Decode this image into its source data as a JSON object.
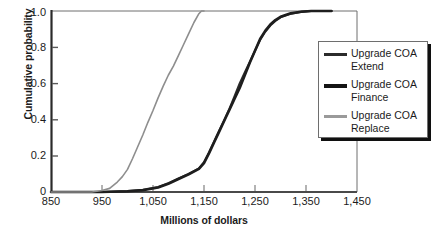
{
  "chart_data": {
    "type": "line",
    "title": "",
    "xlabel": "Millions of dollars",
    "ylabel": "Cumulative probability",
    "xlim": [
      850,
      1450
    ],
    "ylim": [
      0,
      1.0
    ],
    "grid": false,
    "legend_position": "right",
    "xticks": [
      "850",
      "950",
      "1,050",
      "1,150",
      "1,250",
      "1,350",
      "1,450"
    ],
    "xtick_values": [
      850,
      950,
      1050,
      1150,
      1250,
      1350,
      1450
    ],
    "yticks": [
      "0",
      "0.2",
      "0.4",
      "0.6",
      "0.8",
      "1.0"
    ],
    "ytick_values": [
      0,
      0.2,
      0.4,
      0.6,
      0.8,
      1.0
    ],
    "series": [
      {
        "name": "Upgrade COA Extend",
        "color": "#2b2b2b",
        "width": 2.1,
        "x": [
          850,
          950,
          1000,
          1030,
          1060,
          1080,
          1100,
          1120,
          1140,
          1150,
          1160,
          1170,
          1180,
          1190,
          1200,
          1210,
          1220,
          1230,
          1240,
          1250,
          1260,
          1270,
          1280,
          1290,
          1300,
          1320,
          1340,
          1360,
          1400
        ],
        "y": [
          0.0,
          0.0,
          0.005,
          0.012,
          0.028,
          0.048,
          0.075,
          0.1,
          0.13,
          0.165,
          0.22,
          0.28,
          0.34,
          0.4,
          0.46,
          0.53,
          0.6,
          0.66,
          0.72,
          0.78,
          0.84,
          0.885,
          0.92,
          0.945,
          0.965,
          0.985,
          0.995,
          1.0,
          1.0
        ]
      },
      {
        "name": "Upgrade COA Finance",
        "color": "#1e1e1e",
        "width": 2.6,
        "x": [
          850,
          950,
          1000,
          1030,
          1060,
          1080,
          1100,
          1120,
          1140,
          1150,
          1160,
          1170,
          1180,
          1190,
          1200,
          1210,
          1220,
          1230,
          1240,
          1250,
          1260,
          1270,
          1280,
          1290,
          1300,
          1320,
          1340,
          1360,
          1400
        ],
        "y": [
          0.0,
          0.0,
          0.004,
          0.01,
          0.025,
          0.045,
          0.072,
          0.098,
          0.128,
          0.16,
          0.215,
          0.275,
          0.335,
          0.395,
          0.455,
          0.515,
          0.575,
          0.645,
          0.715,
          0.78,
          0.845,
          0.89,
          0.925,
          0.95,
          0.968,
          0.987,
          0.996,
          1.0,
          1.0
        ]
      },
      {
        "name": "Upgrade COA Replace",
        "color": "#8e8e8e",
        "width": 1.6,
        "x": [
          850,
          930,
          950,
          965,
          980,
          990,
          1000,
          1010,
          1020,
          1030,
          1040,
          1050,
          1060,
          1070,
          1080,
          1090,
          1100,
          1110,
          1120,
          1130,
          1140,
          1145,
          1150
        ],
        "y": [
          0.0,
          0.0,
          0.008,
          0.02,
          0.055,
          0.085,
          0.125,
          0.185,
          0.25,
          0.315,
          0.385,
          0.45,
          0.52,
          0.585,
          0.645,
          0.695,
          0.755,
          0.815,
          0.875,
          0.935,
          0.985,
          1.0,
          1.0
        ]
      }
    ]
  },
  "legend": {
    "items": [
      {
        "label_line1": "Upgrade COA",
        "label_line2": "Extend",
        "color": "#2b2b2b",
        "thickness": "3px"
      },
      {
        "label_line1": "Upgrade COA",
        "label_line2": "Finance",
        "color": "#141414",
        "thickness": "4px"
      },
      {
        "label_line1": "Upgrade COA",
        "label_line2": "Replace",
        "color": "#9a9a9a",
        "thickness": "3px"
      }
    ]
  },
  "axes": {
    "frame_color": "#5d5d5d",
    "axis_color": "#2a2a2a"
  }
}
